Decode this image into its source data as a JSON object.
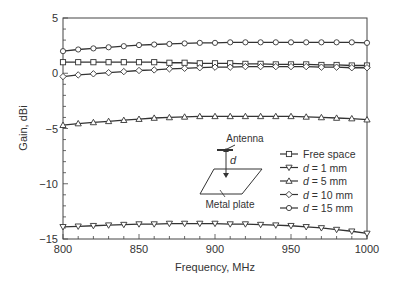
{
  "chart_data": {
    "type": "line",
    "title": "",
    "xlabel": "Frequency, MHz",
    "ylabel": "Gain, dBi",
    "xlim": [
      800,
      1000
    ],
    "ylim": [
      -15,
      5
    ],
    "xticks": [
      800,
      850,
      900,
      950,
      1000
    ],
    "xtick_labels": [
      "800",
      "850",
      "900",
      "950",
      "1000"
    ],
    "yticks": [
      -15,
      -10,
      -5,
      0,
      5
    ],
    "ytick_labels": [
      "−15",
      "−10",
      "−5",
      "0",
      "5"
    ],
    "grid": false,
    "legend_position": "lower right (inside)",
    "x": [
      800,
      810,
      820,
      830,
      840,
      850,
      860,
      870,
      880,
      890,
      900,
      910,
      920,
      930,
      940,
      950,
      960,
      970,
      980,
      990,
      1000
    ],
    "series": [
      {
        "name": "Free space",
        "marker": "square",
        "values": [
          1.0,
          1.0,
          1.0,
          1.0,
          1.0,
          1.0,
          1.0,
          0.95,
          0.95,
          0.9,
          0.9,
          0.9,
          0.85,
          0.85,
          0.8,
          0.8,
          0.8,
          0.75,
          0.75,
          0.7,
          0.7
        ]
      },
      {
        "name": "d = 1 mm",
        "marker": "triangle-down",
        "values": [
          -13.9,
          -13.85,
          -13.8,
          -13.75,
          -13.7,
          -13.65,
          -13.65,
          -13.6,
          -13.6,
          -13.6,
          -13.6,
          -13.65,
          -13.65,
          -13.7,
          -13.75,
          -13.8,
          -13.9,
          -14.0,
          -14.15,
          -14.3,
          -14.5
        ]
      },
      {
        "name": "d = 5 mm",
        "marker": "triangle-up",
        "values": [
          -4.7,
          -4.55,
          -4.45,
          -4.35,
          -4.25,
          -4.15,
          -4.05,
          -4.0,
          -3.95,
          -3.9,
          -3.9,
          -3.9,
          -3.9,
          -3.9,
          -3.9,
          -3.9,
          -3.95,
          -4.0,
          -4.05,
          -4.1,
          -4.2
        ]
      },
      {
        "name": "d = 10 mm",
        "marker": "diamond",
        "values": [
          -0.3,
          -0.15,
          -0.05,
          0.05,
          0.15,
          0.25,
          0.3,
          0.4,
          0.45,
          0.5,
          0.55,
          0.55,
          0.6,
          0.6,
          0.6,
          0.6,
          0.6,
          0.55,
          0.55,
          0.5,
          0.5
        ]
      },
      {
        "name": "d = 15 mm",
        "marker": "circle",
        "values": [
          2.0,
          2.15,
          2.25,
          2.35,
          2.45,
          2.55,
          2.6,
          2.65,
          2.7,
          2.75,
          2.75,
          2.8,
          2.8,
          2.8,
          2.8,
          2.8,
          2.8,
          2.8,
          2.8,
          2.8,
          2.75
        ]
      }
    ],
    "annotations": [
      {
        "text": "Antenna",
        "role": "inset label"
      },
      {
        "text": "d",
        "role": "inset distance label"
      },
      {
        "text": "Metal plate",
        "role": "inset label"
      }
    ]
  },
  "legend": {
    "items": [
      {
        "prefix": "",
        "label": "Free space",
        "marker": "square"
      },
      {
        "prefix": "d",
        "label": " = 1 mm",
        "marker": "triangle-down"
      },
      {
        "prefix": "d",
        "label": " = 5 mm",
        "marker": "triangle-up"
      },
      {
        "prefix": "d",
        "label": " = 10 mm",
        "marker": "diamond"
      },
      {
        "prefix": "d",
        "label": " = 15 mm",
        "marker": "circle"
      }
    ]
  },
  "inset": {
    "antenna_label": "Antenna",
    "distance_label": "d",
    "plate_label": "Metal plate"
  },
  "colors": {
    "line": "#333333",
    "axis": "#444444",
    "marker_fill": "#ffffff"
  }
}
